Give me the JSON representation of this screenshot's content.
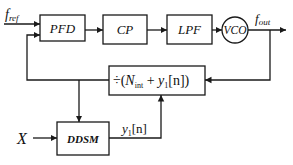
{
  "diagram": {
    "blocks": {
      "pfd": "PFD",
      "cp": "CP",
      "lpf": "LPF",
      "vco": "VCO",
      "divider_prefix": "÷(",
      "divider_N": "N",
      "divider_N_sub": "int",
      "divider_plus": " + ",
      "divider_y": "y",
      "divider_y_sub": "1",
      "divider_suffix": "[n])",
      "ddsm": "DDSM"
    },
    "signals": {
      "f_ref": "f",
      "f_ref_sub": "ref",
      "f_out": "f",
      "f_out_sub": "out",
      "x_input": "X",
      "y1": "y",
      "y1_sub": "1",
      "y1_suffix": "[n]"
    },
    "colors": {
      "line": "#1a1a1a",
      "background": "#ffffff"
    }
  }
}
